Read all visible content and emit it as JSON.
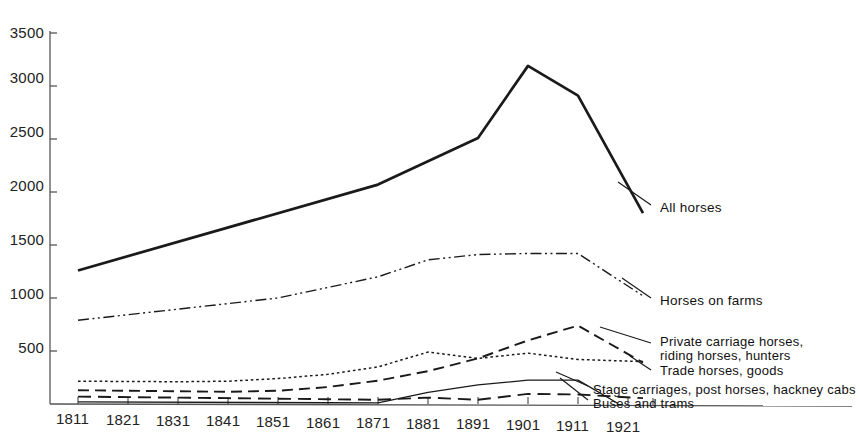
{
  "chart_data": {
    "type": "line",
    "title": "",
    "xlabel": "",
    "ylabel": "",
    "x": [
      1811,
      1821,
      1831,
      1841,
      1851,
      1861,
      1871,
      1881,
      1891,
      1901,
      1911,
      1921
    ],
    "xlim": [
      1811,
      1926
    ],
    "ylim": [
      0,
      3500
    ],
    "yticks": [
      500,
      1000,
      1500,
      2000,
      2500,
      3000,
      3500
    ],
    "xticks": [
      1811,
      1821,
      1831,
      1841,
      1851,
      1861,
      1871,
      1881,
      1891,
      1901,
      1911,
      1921
    ],
    "grid": false,
    "legend_position": "right-inline-labels",
    "series": [
      {
        "name": "All horses",
        "style": "solid-thick",
        "x": [
          1811,
          1871,
          1891,
          1901,
          1911,
          1924
        ],
        "values": [
          1260,
          2070,
          2510,
          3190,
          2910,
          1800
        ]
      },
      {
        "name": "Horses on farms",
        "style": "dash-dot-dot",
        "x": [
          1811,
          1851,
          1871,
          1881,
          1891,
          1901,
          1911,
          1924
        ],
        "values": [
          790,
          1000,
          1200,
          1360,
          1410,
          1420,
          1420,
          1020
        ]
      },
      {
        "name": "Private carriage horses, riding horses, hunters",
        "style": "long-dash",
        "x": [
          1811,
          1841,
          1851,
          1861,
          1871,
          1881,
          1891,
          1901,
          1911,
          1924
        ],
        "values": [
          130,
          115,
          125,
          160,
          220,
          310,
          430,
          600,
          740,
          390
        ]
      },
      {
        "name": "Trade horses, goods",
        "style": "dotted",
        "x": [
          1811,
          1831,
          1841,
          1851,
          1861,
          1871,
          1881,
          1891,
          1901,
          1911,
          1924
        ],
        "values": [
          215,
          210,
          215,
          240,
          280,
          350,
          490,
          430,
          480,
          420,
          400
        ]
      },
      {
        "name": "Stage carriages, post horses, hackney cabs",
        "style": "medium-dash",
        "x": [
          1811,
          1841,
          1861,
          1871,
          1881,
          1891,
          1901,
          1911,
          1924
        ],
        "values": [
          70,
          55,
          45,
          40,
          60,
          40,
          95,
          90,
          55
        ]
      },
      {
        "name": "Buses and trams",
        "style": "solid-thin",
        "x": [
          1811,
          1861,
          1871,
          1881,
          1891,
          1901,
          1911,
          1919
        ],
        "values": [
          20,
          12,
          10,
          110,
          180,
          225,
          225,
          5
        ]
      }
    ],
    "series_labels": [
      {
        "text": "All horses",
        "anchor_x": 1924,
        "anchor_y": 1800
      },
      {
        "text": "Horses on farms",
        "anchor_x": 1924,
        "anchor_y": 1020
      },
      {
        "text": "Private carriage horses,",
        "anchor_x": 1924,
        "anchor_y": 430
      },
      {
        "text": "riding horses, hunters",
        "anchor_x": 1924,
        "anchor_y": 390
      },
      {
        "text": "Trade horses, goods",
        "anchor_x": 1924,
        "anchor_y": 330
      },
      {
        "text": "Stage carriages, post horses, hackney cabs",
        "anchor_x": 1924,
        "anchor_y": 160
      },
      {
        "text": "Buses and trams",
        "anchor_x": 1924,
        "anchor_y": 90
      }
    ],
    "colors": {
      "line": "#1a1a1a",
      "axis": "#555555",
      "background": "#ffffff",
      "text": "#1a1a1a"
    }
  },
  "axes": {
    "y_tick_labels": [
      "3500",
      "3000",
      "2500",
      "2000",
      "1500",
      "1000",
      "500"
    ],
    "x_tick_labels": [
      "1811",
      "1821",
      "1831",
      "1841",
      "1851",
      "1861",
      "1871",
      "1881",
      "1891",
      "1901",
      "1911",
      "1921"
    ]
  },
  "labels": {
    "all_horses": "All horses",
    "horses_on_farms": "Horses on farms",
    "private_carriage_1": "Private carriage horses,",
    "private_carriage_2": "riding horses, hunters",
    "trade_horses": "Trade horses, goods",
    "stage_carriages": "Stage carriages, post horses, hackney cabs",
    "buses_and_trams": "Buses and trams"
  }
}
